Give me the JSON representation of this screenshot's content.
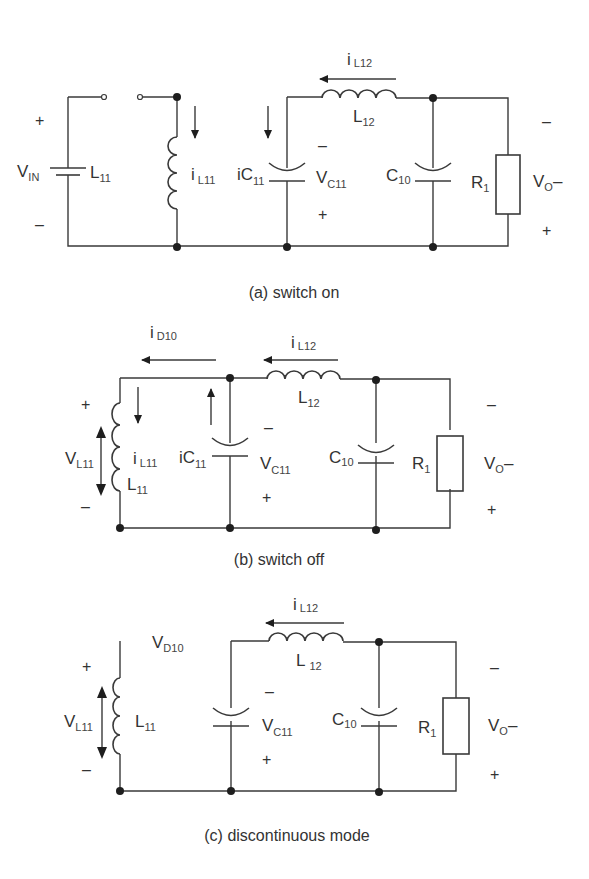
{
  "figure": {
    "panels": [
      {
        "id": "a",
        "caption": "(a) switch on",
        "labels": {
          "vin_main": "V",
          "vin_sub": "IN",
          "l11_main": "L",
          "l11_sub": "11",
          "il11_main": "i",
          "il11_sub": "L11",
          "ic11_main": "iC",
          "ic11_sub": "11",
          "vc11_main": "V",
          "vc11_sub": "C11",
          "il12_main": "i",
          "il12_sub": "L12",
          "l12_main": "L",
          "l12_sub": "12",
          "c10_main": "C",
          "c10_sub": "10",
          "r1_main": "R",
          "r1_sub": "1",
          "vo_main": "V",
          "vo_sub": "O",
          "vo_suffix": "–",
          "vin_plus": "+",
          "vin_minus": "–",
          "vc11_minus": "–",
          "vc11_plus": "+",
          "vo_minus": "–",
          "vo_plus": "+"
        }
      },
      {
        "id": "b",
        "caption": "(b) switch off",
        "labels": {
          "id10_main": "i",
          "id10_sub": "D10",
          "vl11_main": "V",
          "vl11_sub": "L11",
          "il11_main": "i",
          "il11_sub": "L11",
          "l11_main": "L",
          "l11_sub": "11",
          "ic11_main": "iC",
          "ic11_sub": "11",
          "vc11_main": "V",
          "vc11_sub": "C11",
          "il12_main": "i",
          "il12_sub": "L12",
          "l12_main": "L",
          "l12_sub": "12",
          "c10_main": "C",
          "c10_sub": "10",
          "r1_main": "R",
          "r1_sub": "1",
          "vo_main": "V",
          "vo_sub": "O",
          "vo_suffix": "–",
          "vl11_plus": "+",
          "vl11_minus": "–",
          "vc11_minus": "–",
          "vc11_plus": "+",
          "vo_minus": "–",
          "vo_plus": "+"
        }
      },
      {
        "id": "c",
        "caption": "(c) discontinuous mode",
        "labels": {
          "vd10_main": "V",
          "vd10_sub": "D10",
          "vl11_main": "V",
          "vl11_sub": "L11",
          "l11_main": "L",
          "l11_sub": "11",
          "vc11_main": "V",
          "vc11_sub": "C11",
          "il12_main": "i",
          "il12_sub": "L12",
          "l12_main": "L",
          "l12_sub": "12",
          "c10_main": "C",
          "c10_sub": "10",
          "r1_main": "R",
          "r1_sub": "1",
          "vo_main": "V",
          "vo_sub": "O",
          "vo_suffix": "–",
          "vl11_plus": "+",
          "vl11_minus": "–",
          "vc11_minus": "–",
          "vc11_plus": "+",
          "vo_minus": "–",
          "vo_plus": "+"
        }
      }
    ]
  }
}
